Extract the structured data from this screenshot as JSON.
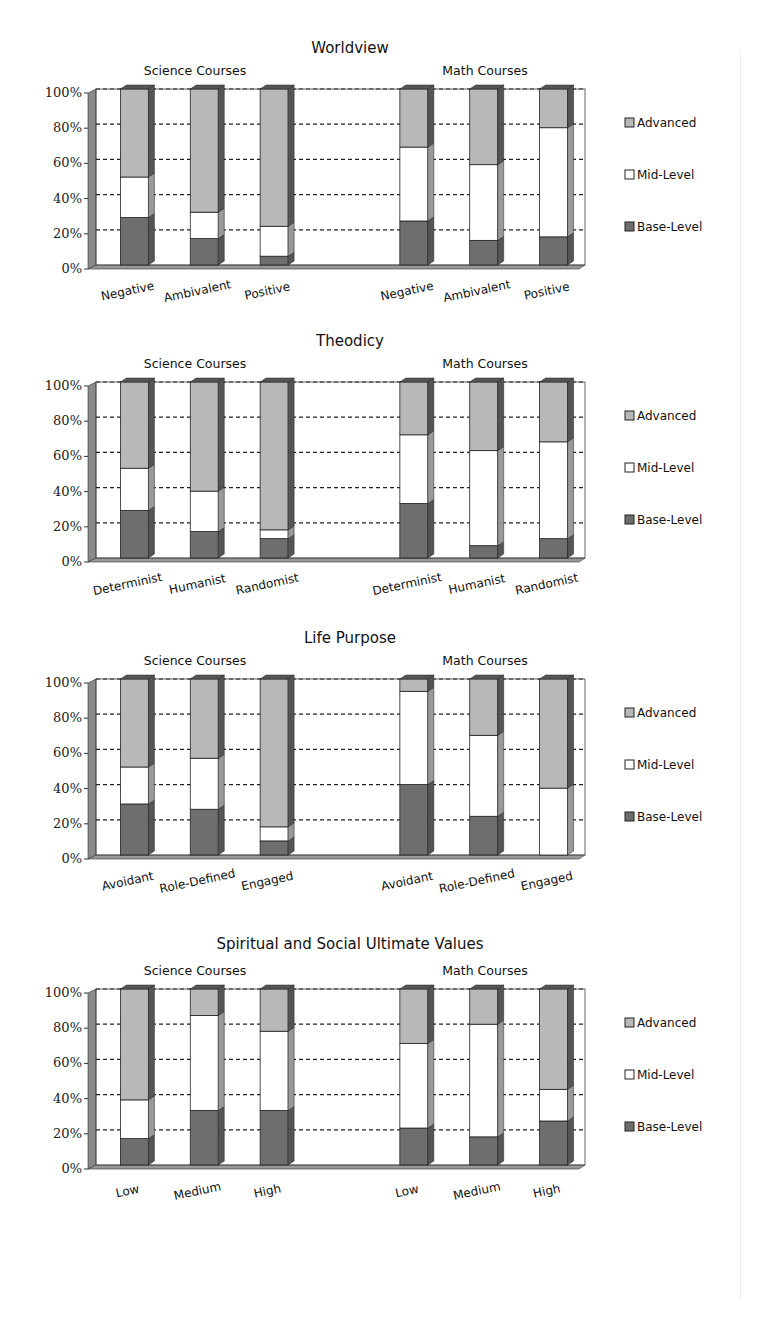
{
  "legend": [
    "Advanced",
    "Mid-Level",
    "Base-Level"
  ],
  "colors": {
    "Advanced": "#b8b8b8",
    "Mid-Level": "#ffffff",
    "Base-Level": "#6e6e6e",
    "side": "#8a8a8a",
    "grid": "#222222"
  },
  "chart_data": [
    {
      "type": "bar",
      "stacked": true,
      "title": "Worldview",
      "groups": [
        {
          "name": "Science Courses",
          "categories": [
            "Negative",
            "Ambivalent",
            "Positive"
          ],
          "series": [
            {
              "name": "Base-Level",
              "values": [
                27,
                15,
                5
              ]
            },
            {
              "name": "Mid-Level",
              "values": [
                23,
                15,
                17
              ]
            },
            {
              "name": "Advanced",
              "values": [
                50,
                70,
                78
              ]
            }
          ]
        },
        {
          "name": "Math Courses",
          "categories": [
            "Negative",
            "Ambivalent",
            "Positive"
          ],
          "series": [
            {
              "name": "Base-Level",
              "values": [
                25,
                14,
                16
              ]
            },
            {
              "name": "Mid-Level",
              "values": [
                42,
                43,
                62
              ]
            },
            {
              "name": "Advanced",
              "values": [
                33,
                43,
                22
              ]
            }
          ]
        }
      ],
      "yticks": [
        "0%",
        "20%",
        "40%",
        "60%",
        "80%",
        "100%"
      ],
      "ylim": [
        0,
        100
      ]
    },
    {
      "type": "bar",
      "stacked": true,
      "title": "Theodicy",
      "groups": [
        {
          "name": "Science Courses",
          "categories": [
            "Determinist",
            "Humanist",
            "Randomist"
          ],
          "series": [
            {
              "name": "Base-Level",
              "values": [
                27,
                15,
                11
              ]
            },
            {
              "name": "Mid-Level",
              "values": [
                24,
                23,
                5
              ]
            },
            {
              "name": "Advanced",
              "values": [
                49,
                62,
                84
              ]
            }
          ]
        },
        {
          "name": "Math Courses",
          "categories": [
            "Determinist",
            "Humanist",
            "Randomist"
          ],
          "series": [
            {
              "name": "Base-Level",
              "values": [
                31,
                7,
                11
              ]
            },
            {
              "name": "Mid-Level",
              "values": [
                39,
                54,
                55
              ]
            },
            {
              "name": "Advanced",
              "values": [
                30,
                39,
                34
              ]
            }
          ]
        }
      ],
      "yticks": [
        "0%",
        "20%",
        "40%",
        "60%",
        "80%",
        "100%"
      ],
      "ylim": [
        0,
        100
      ]
    },
    {
      "type": "bar",
      "stacked": true,
      "title": "Life Purpose",
      "groups": [
        {
          "name": "Science Courses",
          "categories": [
            "Avoidant",
            "Role-Defined",
            "Engaged"
          ],
          "series": [
            {
              "name": "Base-Level",
              "values": [
                29,
                26,
                8
              ]
            },
            {
              "name": "Mid-Level",
              "values": [
                21,
                29,
                8
              ]
            },
            {
              "name": "Advanced",
              "values": [
                50,
                45,
                84
              ]
            }
          ]
        },
        {
          "name": "Math Courses",
          "categories": [
            "Avoidant",
            "Role-Defined",
            "Engaged"
          ],
          "series": [
            {
              "name": "Base-Level",
              "values": [
                40,
                22,
                0
              ]
            },
            {
              "name": "Mid-Level",
              "values": [
                53,
                46,
                38
              ]
            },
            {
              "name": "Advanced",
              "values": [
                7,
                32,
                62
              ]
            }
          ]
        }
      ],
      "yticks": [
        "0%",
        "20%",
        "40%",
        "60%",
        "80%",
        "100%"
      ],
      "ylim": [
        0,
        100
      ]
    },
    {
      "type": "bar",
      "stacked": true,
      "title": "Spiritual and Social Ultimate Values",
      "groups": [
        {
          "name": "Science Courses",
          "categories": [
            "Low",
            "Medium",
            "High"
          ],
          "series": [
            {
              "name": "Base-Level",
              "values": [
                15,
                31,
                31
              ]
            },
            {
              "name": "Mid-Level",
              "values": [
                22,
                54,
                45
              ]
            },
            {
              "name": "Advanced",
              "values": [
                63,
                15,
                24
              ]
            }
          ]
        },
        {
          "name": "Math Courses",
          "categories": [
            "Low",
            "Medium",
            "High"
          ],
          "series": [
            {
              "name": "Base-Level",
              "values": [
                21,
                16,
                25
              ]
            },
            {
              "name": "Mid-Level",
              "values": [
                48,
                64,
                18
              ]
            },
            {
              "name": "Advanced",
              "values": [
                31,
                20,
                57
              ]
            }
          ]
        }
      ],
      "yticks": [
        "0%",
        "20%",
        "40%",
        "60%",
        "80%",
        "100%"
      ],
      "ylim": [
        0,
        100
      ]
    }
  ],
  "layout_tops": [
    75,
    368,
    665,
    975
  ]
}
